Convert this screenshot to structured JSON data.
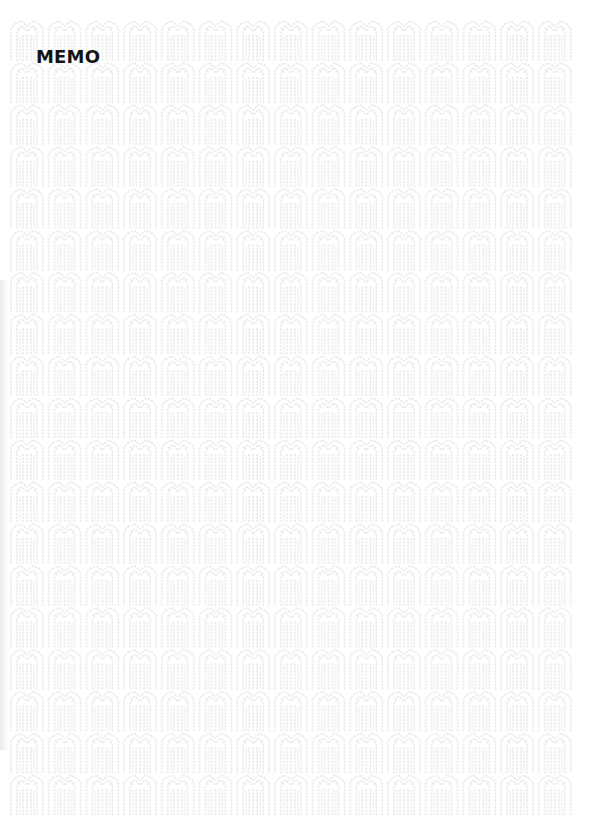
{
  "document": {
    "title": "MEMO",
    "pattern": {
      "motif": "stylized-m-line-pattern",
      "color": "#e3e3e3",
      "columns": 15,
      "rows": 19
    },
    "colors": {
      "background": "#ffffff",
      "title": "#141414"
    }
  }
}
